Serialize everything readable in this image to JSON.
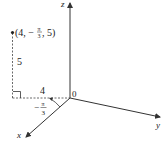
{
  "diagram": {
    "type": "cylindrical-coordinates",
    "axes": {
      "x_label": "x",
      "y_label": "y",
      "z_label": "z",
      "origin_label": "0"
    },
    "point": {
      "label_open": "(4, −",
      "label_pi": "π",
      "label_den": "3",
      "label_close": ", 5)",
      "r": 4,
      "theta": "−π/3",
      "z": 5
    },
    "labels": {
      "height": "5",
      "radius": "4",
      "angle_sign": "−",
      "angle_num": "π",
      "angle_den": "3"
    },
    "colors": {
      "stroke": "#333333",
      "background": "#ffffff"
    }
  }
}
